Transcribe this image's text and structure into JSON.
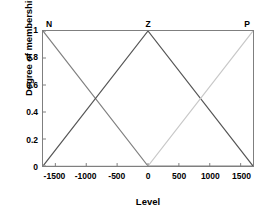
{
  "chart_data": {
    "type": "line",
    "title": "",
    "xlabel": "Level",
    "ylabel": "Degree of membership",
    "xlim": [
      -1700,
      1700
    ],
    "ylim": [
      0,
      1
    ],
    "grid": false,
    "legend_position": "in-plot-top-labels",
    "xticks": [
      -1500,
      -1000,
      -500,
      0,
      500,
      1000,
      1500
    ],
    "xticklabels": [
      "-1500",
      "-1000",
      "-500",
      "0",
      "500",
      "1000",
      "1500"
    ],
    "yticks": [
      0,
      0.2,
      0.4,
      0.6,
      0.8,
      1
    ],
    "yticklabels": [
      "0",
      "0.2",
      "0.4",
      "0.6",
      "0.8",
      "1"
    ],
    "series": [
      {
        "name": "N",
        "color": "#808080",
        "label_x": -1700,
        "label_y": 1,
        "x": [
          -1700,
          0,
          1700
        ],
        "y": [
          1,
          0,
          0
        ]
      },
      {
        "name": "Z",
        "color": "#555555",
        "label_x": 0,
        "label_y": 1,
        "x": [
          -1700,
          0,
          1700
        ],
        "y": [
          0,
          1,
          0
        ]
      },
      {
        "name": "P",
        "color": "#c8c8c8",
        "label_x": 1700,
        "label_y": 1,
        "x": [
          -1700,
          0,
          1700
        ],
        "y": [
          0,
          0,
          1
        ]
      }
    ],
    "annotations": [
      {
        "text": "N",
        "x": -1700,
        "y": 1
      },
      {
        "text": "Z",
        "x": 0,
        "y": 1
      },
      {
        "text": "P",
        "x": 1700,
        "y": 1
      }
    ],
    "axis_color": "#7f7f7f"
  }
}
